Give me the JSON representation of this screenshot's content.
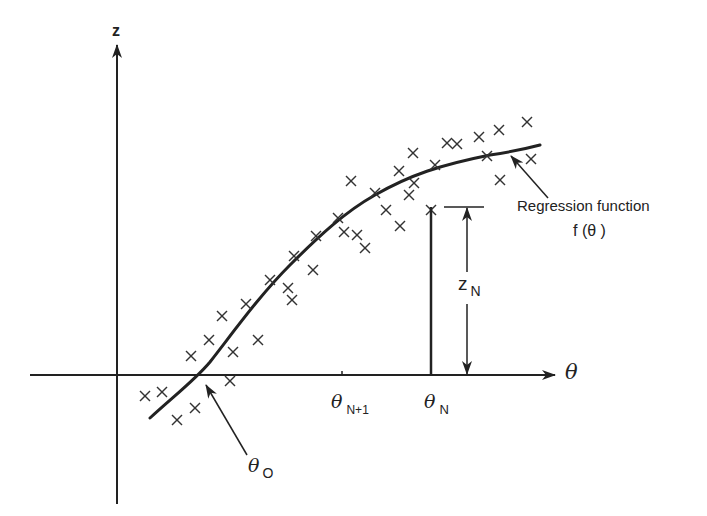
{
  "diagram": {
    "title": "",
    "colors": {
      "ink": "#222222",
      "background": "#ffffff"
    },
    "axes": {
      "vertical_label": "z",
      "horizontal_label": "θ"
    },
    "labels": {
      "regression_line1": "Regression function",
      "regression_line2": "f (θ )",
      "z_n_main": "z",
      "z_n_sub": "N",
      "theta_n_main": "θ",
      "theta_n_sub": "N",
      "theta_n1_main": "θ",
      "theta_n1_sub": "N+1",
      "theta_o_main": "θ",
      "theta_o_sub": "O"
    },
    "scatter_points": [
      [
        145,
        396
      ],
      [
        162,
        392
      ],
      [
        177,
        420
      ],
      [
        195,
        408
      ],
      [
        230,
        381
      ],
      [
        191,
        356
      ],
      [
        209,
        340
      ],
      [
        233,
        352
      ],
      [
        258,
        340
      ],
      [
        222,
        316
      ],
      [
        246,
        304
      ],
      [
        270,
        280
      ],
      [
        288,
        288
      ],
      [
        294,
        256
      ],
      [
        316,
        236
      ],
      [
        313,
        270
      ],
      [
        292,
        300
      ],
      [
        338,
        218
      ],
      [
        351,
        181
      ],
      [
        344,
        232
      ],
      [
        357,
        235
      ],
      [
        365,
        248
      ],
      [
        375,
        193
      ],
      [
        386,
        210
      ],
      [
        400,
        226
      ],
      [
        399,
        171
      ],
      [
        413,
        153
      ],
      [
        409,
        195
      ],
      [
        431,
        210
      ],
      [
        447,
        143
      ],
      [
        435,
        165
      ],
      [
        457,
        144
      ],
      [
        479,
        137
      ],
      [
        487,
        156
      ],
      [
        499,
        130
      ],
      [
        500,
        180
      ],
      [
        527,
        122
      ],
      [
        531,
        159
      ],
      [
        414,
        183
      ]
    ]
  }
}
